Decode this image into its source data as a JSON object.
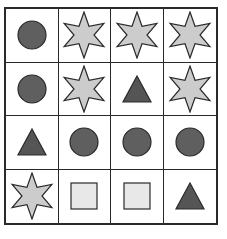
{
  "puzzle": {
    "rows": 4,
    "cols": 4,
    "colors": {
      "circle_fill": "#5f5f5f",
      "triangle_fill": "#555555",
      "star_fill": "#cccccc",
      "square_fill": "#e8e8e8",
      "stroke": "#2a2a2a",
      "grid_line": "#2a2a2a"
    },
    "cells": [
      [
        "circle",
        "star",
        "star",
        "star"
      ],
      [
        "circle",
        "star",
        "triangle",
        "star"
      ],
      [
        "triangle",
        "circle",
        "circle",
        "circle"
      ],
      [
        "star",
        "square",
        "square",
        "triangle"
      ]
    ]
  }
}
